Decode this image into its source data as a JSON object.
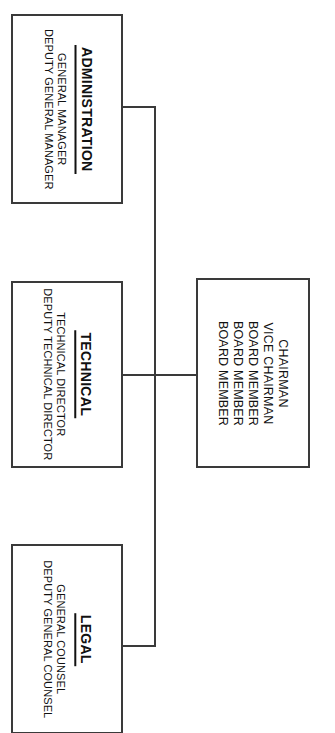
{
  "chart": {
    "type": "org-chart",
    "orientation": "rotated-90-clockwise",
    "background_color": "#ffffff",
    "line_color": "#3a3a3a",
    "text_color": "#111111"
  },
  "board": {
    "name": "board-of-directors",
    "members": [
      "CHAIRMAN",
      "VICE CHAIRMAN",
      "BOARD MEMBER",
      "BOARD MEMBER",
      "BOARD MEMBER"
    ]
  },
  "departments": [
    {
      "key": "administration",
      "title": "ADMINISTRATION",
      "roles": [
        "GENERAL MANAGER",
        "DEPUTY GENERAL MANAGER"
      ]
    },
    {
      "key": "technical",
      "title": "TECHNICAL",
      "roles": [
        "TECHNICAL DIRECTOR",
        "DEPUTY TECHNICAL DIRECTOR"
      ]
    },
    {
      "key": "legal",
      "title": "LEGAL",
      "roles": [
        "GENERAL COUNSEL",
        "DEPUTY GENERAL COUNSEL"
      ]
    }
  ]
}
